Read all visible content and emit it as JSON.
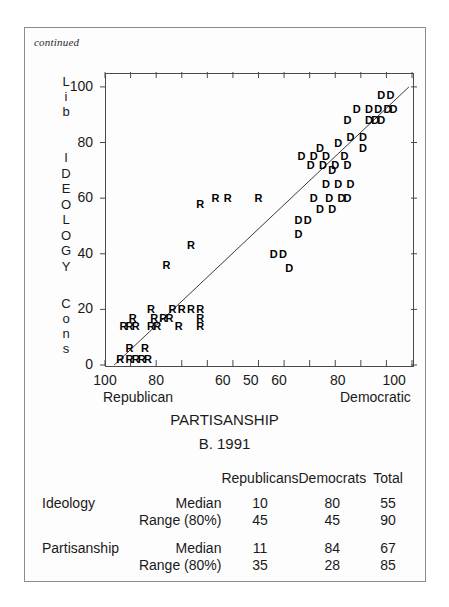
{
  "figure": {
    "continued_note": "continued",
    "panel_caption": "B. 1991",
    "x_axis_title": "PARTISANSHIP",
    "y_axis_title_letters": [
      "I",
      "D",
      "E",
      "O",
      "L",
      "O",
      "G",
      "Y"
    ],
    "y_axis_top_label_letters": [
      "L",
      "i",
      "b"
    ],
    "y_axis_bottom_label_letters": [
      "C",
      "o",
      "n",
      "s"
    ],
    "x_left_end_label": "Republican",
    "x_right_end_label": "Democratic"
  },
  "chart_data": {
    "type": "scatter",
    "title": "PARTISANSHIP",
    "subtitle": "B. 1991",
    "xlabel": "PARTISANSHIP",
    "ylabel": "IDEOLOGY",
    "grid": false,
    "legend": "none",
    "xlim": [
      0,
      100
    ],
    "ylim": [
      0,
      105
    ],
    "x_tick_values": [
      0,
      12.5,
      25,
      37.5,
      50,
      62.5,
      75,
      87.5,
      100
    ],
    "x_tick_labels": [
      "100",
      "",
      "80",
      "",
      "60",
      "50",
      "60",
      "",
      "80",
      "",
      "100"
    ],
    "x_tick_labels_shown": [
      "100",
      "80",
      "60",
      "50",
      "60",
      "80",
      "100"
    ],
    "y_tick_values": [
      0,
      20,
      40,
      60,
      80,
      100
    ],
    "y_tick_labels": [
      "0",
      "20",
      "40",
      "60",
      "80",
      "100"
    ],
    "axis_note": "X axis is a folded partisanship scale: 100 Republican at left, through 50 at center, to 100 Democratic at right.",
    "reference_line": {
      "type": "diagonal",
      "from": [
        3,
        0
      ],
      "to": [
        99,
        100
      ]
    },
    "series": [
      {
        "name": "Republicans",
        "marker": "R",
        "points": [
          [
            5,
            2
          ],
          [
            8,
            2
          ],
          [
            10,
            2
          ],
          [
            12,
            2
          ],
          [
            14,
            2
          ],
          [
            8,
            6
          ],
          [
            13,
            6
          ],
          [
            6,
            14
          ],
          [
            8,
            14
          ],
          [
            10,
            14
          ],
          [
            15,
            14
          ],
          [
            17,
            14
          ],
          [
            24,
            14
          ],
          [
            31,
            14
          ],
          [
            9,
            17
          ],
          [
            16,
            17
          ],
          [
            19,
            17
          ],
          [
            21,
            17
          ],
          [
            31,
            17
          ],
          [
            15,
            20
          ],
          [
            22,
            20
          ],
          [
            25,
            20
          ],
          [
            28,
            20
          ],
          [
            31,
            20
          ],
          [
            20,
            36
          ],
          [
            28,
            43
          ],
          [
            31,
            58
          ],
          [
            36,
            60
          ],
          [
            40,
            60
          ],
          [
            50,
            60
          ]
        ]
      },
      {
        "name": "Democrats",
        "marker": "D",
        "points": [
          [
            60,
            35
          ],
          [
            55,
            40
          ],
          [
            58,
            40
          ],
          [
            63,
            47
          ],
          [
            63,
            52
          ],
          [
            66,
            52
          ],
          [
            70,
            56
          ],
          [
            74,
            56
          ],
          [
            73,
            60
          ],
          [
            77,
            60
          ],
          [
            79,
            60
          ],
          [
            68,
            60
          ],
          [
            72,
            65
          ],
          [
            76,
            65
          ],
          [
            80,
            65
          ],
          [
            74,
            70
          ],
          [
            67,
            72
          ],
          [
            71,
            72
          ],
          [
            75,
            72
          ],
          [
            79,
            72
          ],
          [
            64,
            75
          ],
          [
            68,
            75
          ],
          [
            72,
            75
          ],
          [
            78,
            75
          ],
          [
            70,
            78
          ],
          [
            76,
            80
          ],
          [
            80,
            82
          ],
          [
            84,
            82
          ],
          [
            84,
            78
          ],
          [
            79,
            88
          ],
          [
            86,
            88
          ],
          [
            88,
            88
          ],
          [
            90,
            88
          ],
          [
            82,
            92
          ],
          [
            86,
            92
          ],
          [
            89,
            92
          ],
          [
            92,
            92
          ],
          [
            94,
            92
          ],
          [
            90,
            97
          ],
          [
            93,
            97
          ]
        ]
      }
    ]
  },
  "table": {
    "column_headers": [
      "",
      "",
      "Republicans",
      "Democrats",
      "Total"
    ],
    "rows": [
      {
        "group": "Ideology",
        "stat": "Median",
        "republicans": "10",
        "democrats": "80",
        "total": "55"
      },
      {
        "group": "",
        "stat": "Range (80%)",
        "republicans": "45",
        "democrats": "45",
        "total": "90"
      },
      {
        "group": "Partisanship",
        "stat": "Median",
        "republicans": "11",
        "democrats": "84",
        "total": "67"
      },
      {
        "group": "",
        "stat": "Range (80%)",
        "republicans": "35",
        "democrats": "28",
        "total": "85"
      }
    ]
  },
  "colors": {
    "page_border": "#8c8c8c",
    "axis": "#4a4a4a",
    "text": "#1a1a1a",
    "marker": "#000000"
  }
}
